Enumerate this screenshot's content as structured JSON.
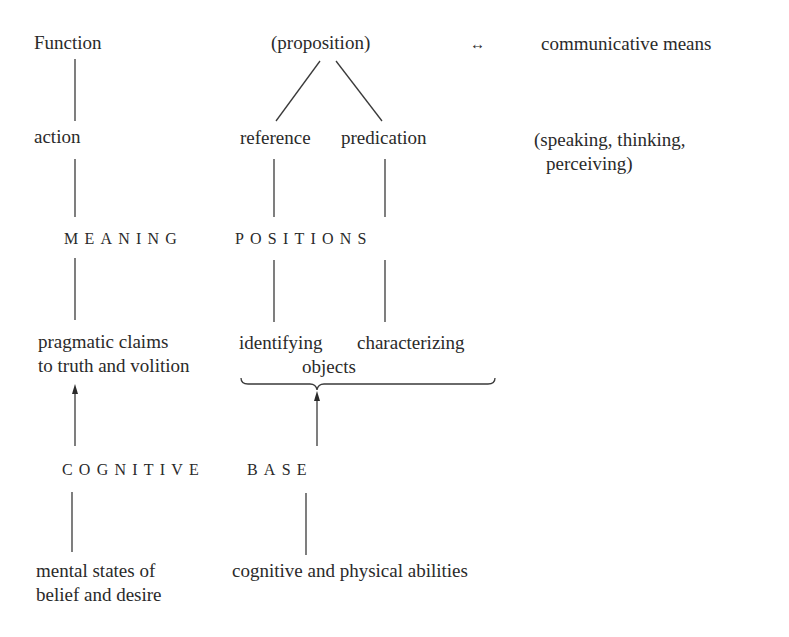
{
  "diagram": {
    "row1": {
      "function": "Function",
      "proposition": "(proposition)",
      "arrow": "↔",
      "communicative_means": "communicative means"
    },
    "row2": {
      "action": "action",
      "reference": "reference",
      "predication": "predication",
      "speaking_line1": "(speaking, thinking,",
      "speaking_line2": "perceiving)"
    },
    "row3": {
      "meaning": "MEANING",
      "positions": "POSITIONS"
    },
    "row4": {
      "pragmatic_line1": "pragmatic claims",
      "pragmatic_line2": "to truth and volition",
      "identifying": "identifying",
      "characterizing": "characterizing",
      "objects": "objects"
    },
    "row5": {
      "cognitive": "COGNITIVE",
      "base": "BASE"
    },
    "row6": {
      "mental_line1": "mental states of",
      "mental_line2": "belief and desire",
      "abilities": "cognitive and physical abilities"
    }
  }
}
